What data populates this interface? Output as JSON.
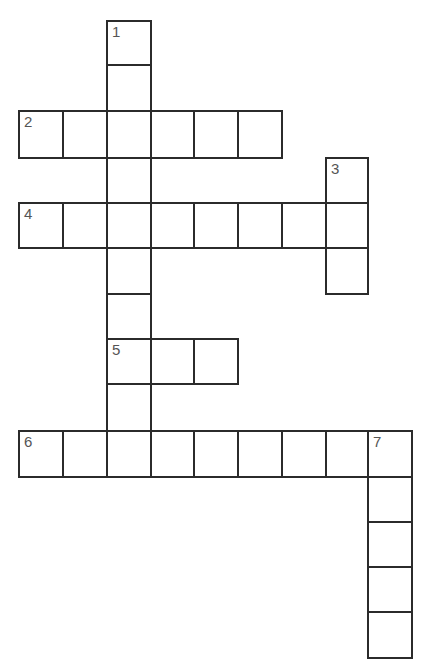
{
  "puzzle": {
    "type": "crossword",
    "cell_size": 44,
    "origin": {
      "x": 18,
      "y": 20
    },
    "clue_numbers": [
      "1",
      "2",
      "3",
      "4",
      "5",
      "6",
      "7"
    ],
    "words": [
      {
        "number": "1",
        "direction": "down",
        "length": 10,
        "col": 2,
        "row": 0
      },
      {
        "number": "2",
        "direction": "across",
        "length": 6,
        "col": 0,
        "row": 2
      },
      {
        "number": "3",
        "direction": "down",
        "length": 3,
        "col": 7,
        "row": 3
      },
      {
        "number": "4",
        "direction": "across",
        "length": 8,
        "col": 0,
        "row": 4
      },
      {
        "number": "5",
        "direction": "across",
        "length": 3,
        "col": 2,
        "row": 7
      },
      {
        "number": "6",
        "direction": "across",
        "length": 9,
        "col": 0,
        "row": 9
      },
      {
        "number": "7",
        "direction": "down",
        "length": 5,
        "col": 8,
        "row": 9
      }
    ]
  }
}
